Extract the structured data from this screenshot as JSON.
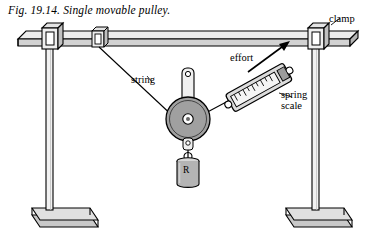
{
  "figure": {
    "caption": "Fig. 19.14.  Single movable pulley.",
    "labels": {
      "string": "string",
      "effort": "effort",
      "clamp": "clamp",
      "spring": "spring",
      "scale": "scale",
      "load": "R"
    },
    "colors": {
      "ink": "#000000",
      "paper": "#ffffff",
      "metal_light": "#e8e8e8",
      "metal_mid": "#b8b8b8",
      "metal_dark": "#8a8a8a",
      "base_fill": "#cfcfcf",
      "pulley_fill": "#9a9a9a",
      "weight_fill": "#b0b0b0",
      "scale_fill": "#d8d8d8"
    }
  }
}
